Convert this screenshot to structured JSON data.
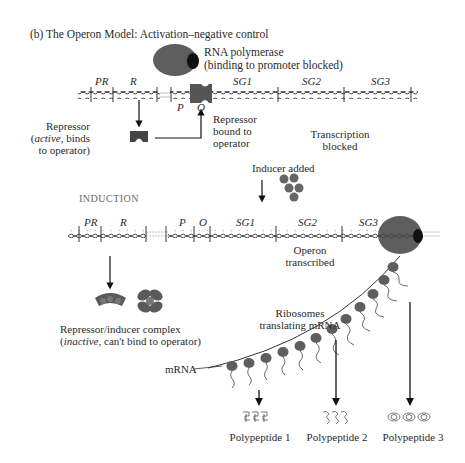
{
  "title": "(b) The Operon Model:  Activation–negative control",
  "top_panel": {
    "rna_polymerase": {
      "label": "RNA polymerase",
      "sublabel": "(binding to promoter blocked)"
    },
    "gene_labels": [
      "PR",
      "R",
      "SG1",
      "SG2",
      "SG3"
    ],
    "p_label": "P",
    "o_label": "O",
    "repressor_active": {
      "line1": "Repressor",
      "line2_italic": "active",
      "line2_rest": ", binds",
      "line3": "to operator)",
      "open_paren": "("
    },
    "repressor_bound": {
      "line1": "Repressor",
      "line2": "bound to",
      "line3": "operator"
    },
    "transcription_blocked": {
      "line1": "Transcription",
      "line2": "blocked"
    }
  },
  "inducer": {
    "label": "Inducer added"
  },
  "bottom_panel": {
    "heading": "INDUCTION",
    "gene_labels": [
      "PR",
      "R",
      "P",
      "O",
      "SG1",
      "SG2",
      "SG3"
    ],
    "operon_transcribed": {
      "line1": "Operon",
      "line2": "transcribed"
    },
    "complex": {
      "line1": "Repressor/inducer complex",
      "line2_italic": "inactive",
      "line2_rest": ", can't bind to operator)",
      "open_paren": "("
    },
    "ribosomes": {
      "line1": "Ribosomes",
      "line2": "translating mRNA"
    },
    "mrna_label": "mRNA",
    "polypeptides": [
      "Polypeptide 1",
      "Polypeptide 2",
      "Polypeptide 3"
    ]
  },
  "colors": {
    "protein": "#5a5a5a",
    "dark": "#1a1a1a",
    "dna": "#3a3a3a"
  }
}
